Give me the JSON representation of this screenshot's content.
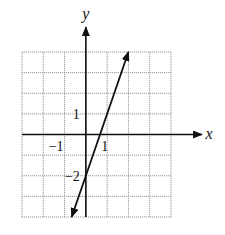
{
  "chart_data": {
    "type": "line",
    "title": "",
    "xlabel": "x",
    "ylabel": "y",
    "xlim": [
      -3,
      4
    ],
    "ylim": [
      -4,
      4
    ],
    "grid": true,
    "tick_labels": {
      "x": [
        {
          "value": -1,
          "label": "−1"
        },
        {
          "value": 1,
          "label": "1"
        }
      ],
      "y": [
        {
          "value": 1,
          "label": "1"
        },
        {
          "value": -2,
          "label": "−2"
        }
      ]
    },
    "series": [
      {
        "name": "y = 3x − 2",
        "slope": 3,
        "intercept": -2,
        "x": [
          -0.667,
          2
        ],
        "y": [
          -4,
          4
        ],
        "arrows_both_ends": true
      }
    ],
    "colors": {
      "line": "#111111",
      "grid": "#9a9a9a",
      "axis": "#111111"
    }
  }
}
